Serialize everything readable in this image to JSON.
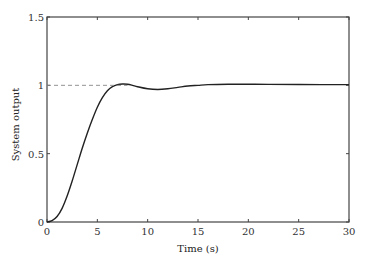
{
  "chart_data": {
    "type": "line",
    "title": "",
    "xlabel": "Time (s)",
    "ylabel": "System output",
    "xlim": [
      0,
      30
    ],
    "ylim": [
      0,
      1.5
    ],
    "xticks": [
      0,
      5,
      10,
      15,
      20,
      25,
      30
    ],
    "yticks": [
      0,
      0.5,
      1,
      1.5
    ],
    "xtick_labels": [
      "0",
      "5",
      "10",
      "15",
      "20",
      "25",
      "30"
    ],
    "ytick_labels": [
      "0",
      "0.5",
      "1",
      "1.5"
    ],
    "grid": false,
    "legend": null,
    "series": [
      {
        "name": "Step response",
        "style": "solid",
        "color": "#222222",
        "x": [
          0,
          0.5,
          1,
          1.5,
          2,
          2.5,
          3,
          3.5,
          4,
          4.5,
          5,
          5.5,
          6,
          6.5,
          7,
          7.5,
          8,
          8.5,
          9,
          10,
          11,
          12,
          13,
          14,
          15,
          16,
          18,
          20,
          22,
          25,
          30
        ],
        "values": [
          0,
          0.01,
          0.04,
          0.1,
          0.19,
          0.3,
          0.42,
          0.54,
          0.65,
          0.75,
          0.84,
          0.91,
          0.96,
          0.99,
          1.005,
          1.01,
          1.008,
          1.0,
          0.99,
          0.975,
          0.97,
          0.975,
          0.985,
          0.995,
          1.0,
          1.005,
          1.008,
          1.008,
          1.007,
          1.006,
          1.005
        ]
      },
      {
        "name": "Reference",
        "style": "dashed",
        "color": "#888888",
        "x": [
          0,
          8
        ],
        "values": [
          1,
          1
        ]
      }
    ]
  }
}
